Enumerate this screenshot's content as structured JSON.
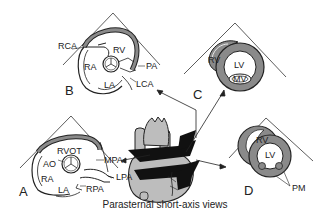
{
  "caption": "Parasternal short-axis views",
  "colors": {
    "outline": "#222222",
    "wall_fill": "#8a8a8a",
    "heart_fill": "#bdbdbd",
    "plane_fill": "#111111",
    "background": "#ffffff"
  },
  "panels": {
    "A": {
      "letter": "A",
      "labels": {
        "rvot": "RVOT",
        "ao": "AO",
        "ra": "RA",
        "la": "LA",
        "mpa": "MPA",
        "lpa": "LPA",
        "rpa": "RPA"
      }
    },
    "B": {
      "letter": "B",
      "labels": {
        "rca": "RCA",
        "rv": "RV",
        "ra": "RA",
        "la": "LA",
        "pa": "PA",
        "lca": "LCA"
      }
    },
    "C": {
      "letter": "C",
      "labels": {
        "rv": "RV",
        "lv": "LV",
        "mv": "MV"
      }
    },
    "D": {
      "letter": "D",
      "labels": {
        "rv": "RV",
        "lv": "LV",
        "pm": "PM"
      }
    }
  }
}
